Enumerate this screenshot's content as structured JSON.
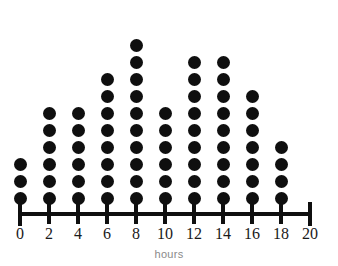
{
  "chart_data": {
    "type": "bar",
    "subtype": "dot-plot",
    "title": "",
    "xlabel": "hours",
    "ylabel": "",
    "grid": false,
    "legend": null,
    "xlim": [
      0,
      20
    ],
    "xtick_step": 2,
    "dot_unit_value": 1,
    "categories": [
      "0",
      "2",
      "4",
      "6",
      "8",
      "10",
      "12",
      "14",
      "16",
      "18",
      "20"
    ],
    "values": [
      3,
      6,
      6,
      8,
      10,
      6,
      9,
      9,
      7,
      4,
      0
    ],
    "tick_labels": [
      "0",
      "2",
      "4",
      "6",
      "8",
      "10",
      "12",
      "14",
      "16",
      "18",
      "20"
    ],
    "max_count": 10,
    "total_dots": 68,
    "colors": {
      "dot": "#0f0f0f",
      "axis": "#0f0f0f",
      "tick_label": "#1a1a1a",
      "axis_title": "#8a8a8a",
      "background": "#ffffff"
    }
  }
}
